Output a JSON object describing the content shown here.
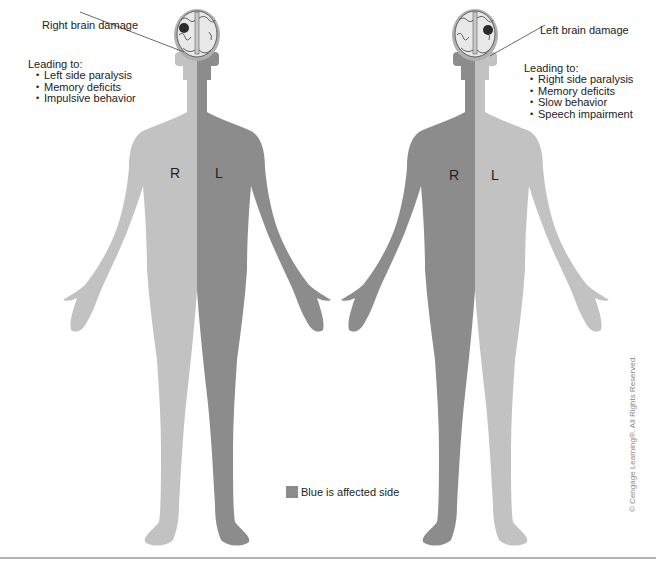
{
  "colors": {
    "affected_side": "#8c8c8c",
    "unaffected_side": "#c2c2c2",
    "brain_fill": "#e8e8e8",
    "lesion": "#2a2a2a",
    "text": "#222222",
    "separator": "#666666"
  },
  "left_figure": {
    "callout": "Right brain damage",
    "leading_to_title": "Leading to:",
    "effects": [
      "Left side paralysis",
      "Memory deficits",
      "Impulsive behavior"
    ],
    "side_labels": {
      "right": "R",
      "left": "L"
    },
    "affected_side": "left"
  },
  "right_figure": {
    "callout": "Left brain damage",
    "leading_to_title": "Leading to:",
    "effects": [
      "Right side paralysis",
      "Memory deficits",
      "Slow behavior",
      "Speech impairment"
    ],
    "side_labels": {
      "right": "R",
      "left": "L"
    },
    "affected_side": "right"
  },
  "legend": {
    "label": "Blue is affected side",
    "swatch_icon": "square-swatch"
  },
  "copyright": "© Cengage Learning®. All Rights Reserved."
}
